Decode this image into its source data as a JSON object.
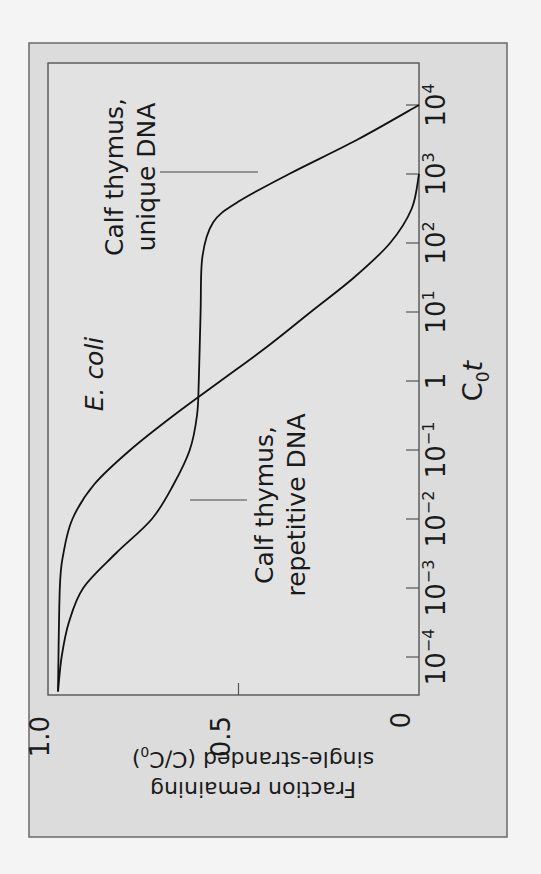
{
  "figure": {
    "orientation": "rotated 90 degrees counter-clockwise",
    "colors": {
      "background": "#dcdcdc",
      "line": "#111111",
      "frame": "#555555"
    }
  },
  "axes": {
    "x_title_main": "C",
    "x_title_sub": "0",
    "x_title_italic": "t",
    "y_title_line1": "Fraction remaining",
    "y_title_line2_pre": "single-stranded (C/C",
    "y_title_line2_sub": "0",
    "y_title_line2_post": ")",
    "x_ticks": [
      {
        "base": "10",
        "exp": "−4",
        "log": -4
      },
      {
        "base": "10",
        "exp": "−3",
        "log": -3
      },
      {
        "base": "10",
        "exp": "−2",
        "log": -2
      },
      {
        "base": "10",
        "exp": "−1",
        "log": -1
      },
      {
        "base": "1",
        "exp": "",
        "log": 0
      },
      {
        "base": "10",
        "exp": "1",
        "log": 1
      },
      {
        "base": "10",
        "exp": "2",
        "log": 2
      },
      {
        "base": "10",
        "exp": "3",
        "log": 3
      },
      {
        "base": "10",
        "exp": "4",
        "log": 4
      }
    ],
    "y_ticks": [
      {
        "label": "0",
        "value": 0
      },
      {
        "label": "0.5",
        "value": 0.5
      },
      {
        "label": "1.0",
        "value": 1.0
      }
    ]
  },
  "annotations": {
    "ecoli": "E. coli",
    "repetitive_line1": "Calf thymus,",
    "repetitive_line2": "repetitive DNA",
    "unique_line1": "Calf thymus,",
    "unique_line2": "unique DNA"
  },
  "chart_data": {
    "type": "line",
    "title": "",
    "xlabel": "C0t",
    "ylabel": "Fraction remaining single-stranded (C/C0)",
    "x_scale": "log10",
    "xlim": [
      -4.6,
      4
    ],
    "ylim": [
      0,
      1.0
    ],
    "grid": false,
    "legend": "none (direct labels)",
    "series": [
      {
        "name": "E. coli",
        "x_log10": [
          -4.5,
          -3,
          -2.5,
          -2,
          -1.5,
          -1,
          -0.5,
          0,
          0.5,
          1,
          1.5,
          2,
          2.5,
          3
        ],
        "values": [
          1.0,
          0.995,
          0.985,
          0.96,
          0.9,
          0.8,
          0.68,
          0.55,
          0.42,
          0.3,
          0.18,
          0.08,
          0.02,
          0.0
        ]
      },
      {
        "name": "Calf thymus (repetitive + unique DNA)",
        "x_log10": [
          -4.5,
          -4,
          -3.5,
          -3,
          -2.5,
          -2,
          -1.5,
          -1,
          -0.5,
          0,
          1,
          1.8,
          2.3,
          2.6,
          3,
          3.5,
          4
        ],
        "values": [
          1.0,
          0.99,
          0.97,
          0.93,
          0.84,
          0.74,
          0.68,
          0.635,
          0.615,
          0.61,
          0.605,
          0.6,
          0.57,
          0.5,
          0.36,
          0.17,
          0.0
        ]
      }
    ]
  }
}
